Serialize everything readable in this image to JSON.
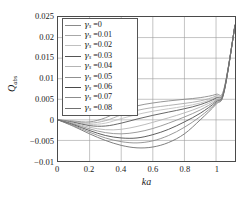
{
  "chart_data": {
    "type": "line",
    "title": "",
    "xlabel": "ka",
    "ylabel_main": "Q",
    "ylabel_sub": "abs",
    "xlim": [
      0,
      1.12
    ],
    "ylim": [
      -0.01,
      0.025
    ],
    "xticks": [
      0,
      0.2,
      0.4,
      0.6,
      0.8,
      1
    ],
    "xticklabels": [
      "0",
      "0.2",
      "0.4",
      "0.6",
      "0.8",
      "1"
    ],
    "yticks": [
      0.025,
      0.02,
      0.015,
      0.01,
      0.005,
      0,
      -0.005,
      -0.01
    ],
    "yticklabels": [
      "0.025",
      "0.02",
      "0.015",
      "0.01",
      "0.005",
      "0",
      "−0.005",
      "−0.01"
    ],
    "grid": true,
    "legend_position": "upper-left",
    "legend_title": "",
    "x": [
      0,
      0.1,
      0.2,
      0.3,
      0.4,
      0.5,
      0.6,
      0.7,
      0.8,
      0.9,
      1.0,
      1.05,
      1.12
    ],
    "series": [
      {
        "name": "γs =0",
        "gamma_symbol": "γ",
        "gamma_sub": "s",
        "gamma_value": "0",
        "color": "#8a8a8a",
        "values": [
          0,
          -0.0003,
          -0.0005,
          0.0005,
          0.0022,
          0.0034,
          0.0041,
          0.0046,
          0.005,
          0.0054,
          0.0062,
          0.0075,
          0.023
        ]
      },
      {
        "name": "γs =0.01",
        "gamma_symbol": "γ",
        "gamma_sub": "s",
        "gamma_value": "0.01",
        "color": "#a8a8a8",
        "values": [
          0,
          -0.0004,
          -0.0008,
          -0.0002,
          0.0012,
          0.0023,
          0.003,
          0.0035,
          0.004,
          0.0046,
          0.0058,
          0.0073,
          0.023
        ]
      },
      {
        "name": "γs =0.02",
        "gamma_symbol": "γ",
        "gamma_sub": "s",
        "gamma_value": "0.02",
        "color": "#c0c0c0",
        "values": [
          0,
          -0.0005,
          -0.0011,
          -0.0008,
          0.0003,
          0.0013,
          0.0021,
          0.0027,
          0.0033,
          0.0041,
          0.0055,
          0.0072,
          0.023
        ]
      },
      {
        "name": "γs =0.03",
        "gamma_symbol": "γ",
        "gamma_sub": "s",
        "gamma_value": "0.03",
        "color": "#555555",
        "values": [
          0,
          -0.0006,
          -0.0014,
          -0.0015,
          -0.0008,
          0.0002,
          0.0011,
          0.0019,
          0.0027,
          0.0037,
          0.0053,
          0.0071,
          0.023
        ]
      },
      {
        "name": "γs =0.04",
        "gamma_symbol": "γ",
        "gamma_sub": "s",
        "gamma_value": "0.04",
        "color": "#b4b4b4",
        "values": [
          0,
          -0.0008,
          -0.0018,
          -0.0024,
          -0.0023,
          -0.0016,
          -0.0006,
          0.0005,
          0.0017,
          0.0031,
          0.005,
          0.007,
          0.023
        ]
      },
      {
        "name": "γs =0.05",
        "gamma_symbol": "γ",
        "gamma_sub": "s",
        "gamma_value": "0.05",
        "color": "#909090",
        "values": [
          0,
          -0.001,
          -0.0022,
          -0.0031,
          -0.0034,
          -0.003,
          -0.0021,
          -0.0008,
          0.0007,
          0.0024,
          0.0047,
          0.0069,
          0.023
        ]
      },
      {
        "name": "γs =0.06",
        "gamma_symbol": "γ",
        "gamma_sub": "s",
        "gamma_value": "0.06",
        "color": "#4a4a4a",
        "values": [
          0,
          -0.0012,
          -0.0026,
          -0.0038,
          -0.0044,
          -0.0044,
          -0.0036,
          -0.0023,
          -0.0005,
          0.0016,
          0.0044,
          0.0068,
          0.023
        ]
      },
      {
        "name": "γs =0.07",
        "gamma_symbol": "γ",
        "gamma_sub": "s",
        "gamma_value": "0.07",
        "color": "#8c8c8c",
        "values": [
          0,
          -0.0014,
          -0.003,
          -0.0044,
          -0.0053,
          -0.0056,
          -0.0051,
          -0.0038,
          -0.0018,
          0.0008,
          0.0041,
          0.0067,
          0.023
        ]
      },
      {
        "name": "γs =0.08",
        "gamma_symbol": "γ",
        "gamma_sub": "s",
        "gamma_value": "0.08",
        "color": "#707070",
        "values": [
          0,
          -0.0016,
          -0.0034,
          -0.005,
          -0.0062,
          -0.0068,
          -0.0066,
          -0.0055,
          -0.0034,
          0.0,
          0.0038,
          0.0066,
          0.023
        ]
      }
    ]
  }
}
